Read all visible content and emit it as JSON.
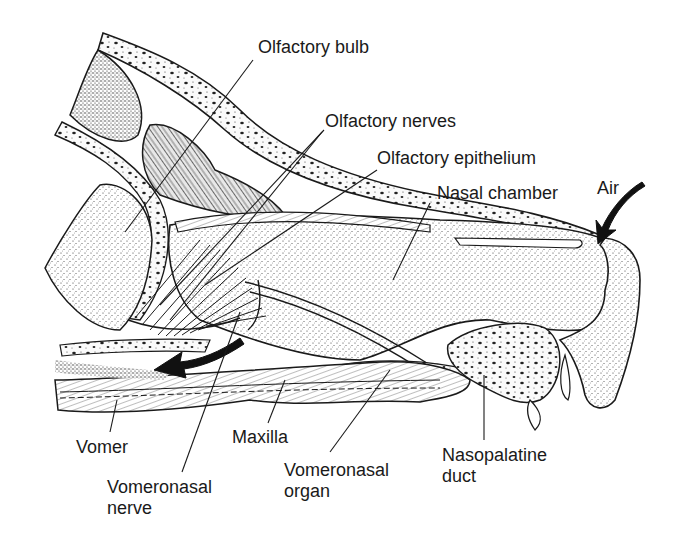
{
  "diagram": {
    "colors": {
      "ink": "#1a1a1a",
      "background": "#ffffff",
      "tissue_light": "#f3f3f3",
      "tissue_dark": "#cfcfcf"
    },
    "labels": {
      "olfactory_bulb": "Olfactory bulb",
      "olfactory_nerves": "Olfactory nerves",
      "olfactory_epithelium": "Olfactory epithelium",
      "nasal_chamber": "Nasal chamber",
      "air": "Air",
      "vomer": "Vomer",
      "maxilla": "Maxilla",
      "vomeronasal_nerve": "Vomeronasal\nnerve",
      "vomeronasal_organ": "Vomeronasal\norgan",
      "nasopalatine_duct": "Nasopalatine\nduct"
    },
    "arrows": [
      {
        "name": "air-inflow-arrow",
        "direction": "down-left",
        "meaning": "Air entering nostril"
      },
      {
        "name": "airflow-posterior-arrow",
        "direction": "left",
        "meaning": "Air flowing posteriorly"
      }
    ]
  }
}
